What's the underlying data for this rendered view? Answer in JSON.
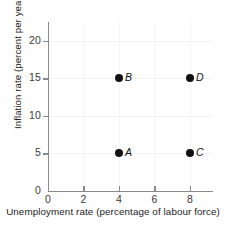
{
  "chart_data": {
    "type": "scatter",
    "title": "",
    "xlabel": "Unemployment rate (percentage of labour force)",
    "ylabel": "Inflation rate (percent per year)",
    "xlim": [
      0,
      9.3
    ],
    "ylim": [
      0,
      22.5
    ],
    "xticks": [
      0,
      2,
      4,
      6,
      8
    ],
    "xticklabels": [
      "0",
      "2",
      "4",
      "6",
      "8"
    ],
    "yticks": [
      0,
      5,
      10,
      15,
      20
    ],
    "yticklabels": [
      "0",
      "5",
      "10",
      "15",
      "20"
    ],
    "grid": "faint",
    "legend": "none",
    "points": [
      {
        "label": "A",
        "x": 4,
        "y": 5
      },
      {
        "label": "B",
        "x": 4,
        "y": 15
      },
      {
        "label": "C",
        "x": 8,
        "y": 5
      },
      {
        "label": "D",
        "x": 8,
        "y": 15
      }
    ],
    "colors": {
      "point": "#111111",
      "axis": "#8a8a8a",
      "text": "#222222",
      "grid": "#f2f2f2",
      "background": "#ffffff"
    }
  }
}
